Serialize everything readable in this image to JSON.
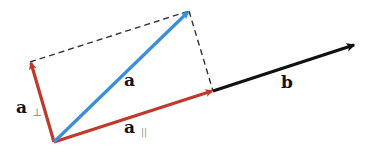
{
  "diagram": {
    "type": "vector-projection",
    "colors": {
      "a": "#3b8fd8",
      "components": "#c0392b",
      "b": "#111111",
      "dashed": "#333333",
      "subscript": "#888888"
    },
    "points": {
      "origin": [
        54,
        142
      ],
      "a_tip": [
        189,
        11
      ],
      "a_parallel_tip": [
        213,
        91
      ],
      "a_perp_tip": [
        30,
        62
      ],
      "b_tip": [
        355,
        45
      ]
    },
    "labels": {
      "a": {
        "text": "a",
        "x": 124,
        "y": 86
      },
      "a_parallel": {
        "text": "a",
        "sub": "||",
        "x": 124,
        "y": 133
      },
      "a_perp": {
        "text": "a",
        "sub": "⊥",
        "x": 16,
        "y": 113
      },
      "b": {
        "text": "b",
        "x": 281,
        "y": 88
      }
    },
    "vectors": [
      {
        "name": "a",
        "from": "origin",
        "to": "a_tip",
        "color": "#3b8fd8"
      },
      {
        "name": "a_parallel",
        "from": "origin",
        "to": "a_parallel_tip",
        "color": "#c0392b"
      },
      {
        "name": "a_perp",
        "from": "origin",
        "to": "a_perp_tip",
        "color": "#c0392b"
      },
      {
        "name": "b",
        "from": "a_parallel_tip",
        "to": "b_tip",
        "color": "#111111"
      }
    ],
    "dashed_lines": [
      {
        "from": "a_perp_tip",
        "to": "a_tip"
      },
      {
        "from": "a_tip",
        "to": "a_parallel_tip"
      }
    ]
  }
}
